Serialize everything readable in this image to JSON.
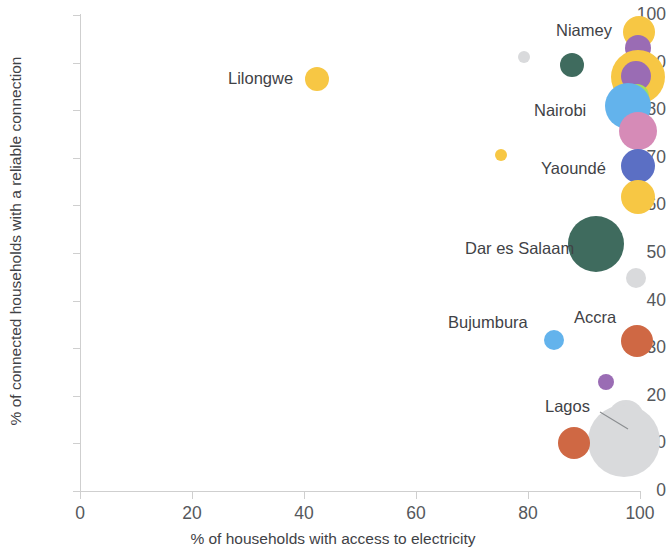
{
  "chart_data": {
    "type": "scatter",
    "title": "",
    "xlabel": "% of households with access to electricity",
    "ylabel": "% of connected households with a reliable connection",
    "xlim": [
      0,
      100
    ],
    "ylim": [
      0,
      100
    ],
    "xticks": [
      "0",
      "20",
      "40",
      "60",
      "80",
      "100"
    ],
    "yticks": [
      "0",
      "10",
      "20",
      "30",
      "40",
      "50",
      "60",
      "70",
      "80",
      "90",
      "100"
    ],
    "grid": false,
    "legend": "none",
    "bubble_encoding": "bubble area encodes city population / number of households",
    "points": [
      {
        "label": "",
        "x": 42.3,
        "y": 86.6,
        "r": 12,
        "color": "#f7c744"
      },
      {
        "label": "",
        "x": 75.2,
        "y": 70.5,
        "r": 6,
        "color": "#f7c744"
      },
      {
        "label": "",
        "x": 79.2,
        "y": 91.2,
        "r": 6,
        "color": "#d9dadc"
      },
      {
        "label": "",
        "x": 87.8,
        "y": 89.6,
        "r": 12,
        "color": "#3f6b5e"
      },
      {
        "label": "",
        "x": 99.9,
        "y": 96.5,
        "r": 16,
        "color": "#f7c744"
      },
      {
        "label": "",
        "x": 99.6,
        "y": 93.0,
        "r": 13,
        "color": "#9a6cb4"
      },
      {
        "label": "",
        "x": 99.7,
        "y": 87.0,
        "r": 27,
        "color": "#f7c744"
      },
      {
        "label": "",
        "x": 99.2,
        "y": 87.2,
        "r": 15,
        "color": "#9a6cb4"
      },
      {
        "label": "",
        "x": 99.4,
        "y": 83.0,
        "r": 12,
        "color": "#a8dd5a"
      },
      {
        "label": "",
        "x": 97.8,
        "y": 80.8,
        "r": 23,
        "color": "#63b3ec"
      },
      {
        "label": "",
        "x": 99.6,
        "y": 75.7,
        "r": 19,
        "color": "#d68bb7"
      },
      {
        "label": "",
        "x": 99.7,
        "y": 68.2,
        "r": 17,
        "color": "#5b6fc4"
      },
      {
        "label": "",
        "x": 99.7,
        "y": 61.8,
        "r": 17,
        "color": "#f7c744"
      },
      {
        "label": "",
        "x": 92.2,
        "y": 51.8,
        "r": 28,
        "color": "#3f6b5e"
      },
      {
        "label": "",
        "x": 99.3,
        "y": 44.8,
        "r": 10,
        "color": "#d9dadc"
      },
      {
        "label": "",
        "x": 84.6,
        "y": 31.8,
        "r": 10,
        "color": "#63b3ec"
      },
      {
        "label": "",
        "x": 99.4,
        "y": 31.5,
        "r": 16,
        "color": "#cf6844"
      },
      {
        "label": "",
        "x": 93.9,
        "y": 22.9,
        "r": 8,
        "color": "#9a6cb4"
      },
      {
        "label": "",
        "x": 97.5,
        "y": 15.3,
        "r": 18,
        "color": "#d9dadc"
      },
      {
        "label": "",
        "x": 97.2,
        "y": 10.4,
        "r": 36,
        "color": "#d9dadc"
      },
      {
        "label": "",
        "x": 88.2,
        "y": 10.0,
        "r": 16,
        "color": "#cf6844"
      }
    ],
    "annotations": [
      {
        "name": "Lilongwe",
        "text": "Lilongwe",
        "x": 228,
        "y": 78,
        "anchor": "left",
        "leader": false
      },
      {
        "name": "Niamey",
        "text": "Niamey",
        "x": 556,
        "y": 30,
        "anchor": "left",
        "leader": false
      },
      {
        "name": "Nairobi",
        "text": "Nairobi",
        "x": 534,
        "y": 110,
        "anchor": "left",
        "leader": false
      },
      {
        "name": "Yaounde",
        "text": "Yaoundé",
        "x": 541,
        "y": 168,
        "anchor": "left",
        "leader": false
      },
      {
        "name": "Dar es Salaam",
        "text": "Dar es Salaam",
        "x": 465,
        "y": 248,
        "anchor": "left",
        "leader": false
      },
      {
        "name": "Bujumbura",
        "text": "Bujumbura",
        "x": 448,
        "y": 322,
        "anchor": "left",
        "leader": false
      },
      {
        "name": "Accra",
        "text": "Accra",
        "x": 574,
        "y": 317,
        "anchor": "left",
        "leader": false
      },
      {
        "name": "Lagos",
        "text": "Lagos",
        "x": 545,
        "y": 406,
        "anchor": "left",
        "leader": true,
        "leader_from": [
          600,
          412
        ],
        "leader_to": [
          628,
          429
        ]
      }
    ]
  },
  "colors": {
    "axis": "#cfcfcf",
    "tick_text": "#55585c",
    "axis_title": "#3f4246",
    "label_text": "#3f4246",
    "background": "#ffffff",
    "yellow": "#f7c744",
    "purple": "#9a6cb4",
    "green_light": "#a8dd5a",
    "blue_light": "#63b3ec",
    "pink": "#d68bb7",
    "indigo": "#5b6fc4",
    "teal_dark": "#3f6b5e",
    "grey": "#d9dadc",
    "orange": "#cf6844"
  }
}
